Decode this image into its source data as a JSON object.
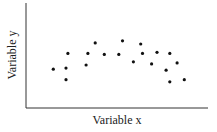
{
  "chart_data": {
    "type": "scatter",
    "title": "",
    "xlabel": "Variable x",
    "ylabel": "Variable y",
    "grid": false,
    "legend": null,
    "xlim": [
      0,
      10
    ],
    "ylim": [
      0,
      10
    ],
    "x_ticks": [],
    "y_ticks": [],
    "points": [
      {
        "x": 1.5,
        "y": 3.7
      },
      {
        "x": 2.3,
        "y": 5.2
      },
      {
        "x": 2.2,
        "y": 3.8
      },
      {
        "x": 2.2,
        "y": 2.7
      },
      {
        "x": 3.3,
        "y": 4.1
      },
      {
        "x": 3.4,
        "y": 5.2
      },
      {
        "x": 3.8,
        "y": 6.2
      },
      {
        "x": 4.3,
        "y": 5.1
      },
      {
        "x": 5.1,
        "y": 5.1
      },
      {
        "x": 5.3,
        "y": 6.4
      },
      {
        "x": 5.9,
        "y": 4.4
      },
      {
        "x": 6.3,
        "y": 6.1
      },
      {
        "x": 6.4,
        "y": 5.2
      },
      {
        "x": 6.9,
        "y": 4.2
      },
      {
        "x": 7.2,
        "y": 5.3
      },
      {
        "x": 7.7,
        "y": 3.6
      },
      {
        "x": 7.9,
        "y": 5.2
      },
      {
        "x": 7.9,
        "y": 2.5
      },
      {
        "x": 8.3,
        "y": 4.3
      },
      {
        "x": 8.7,
        "y": 2.7
      }
    ],
    "colors": {
      "point": "#111111",
      "axis": "#333333"
    }
  }
}
